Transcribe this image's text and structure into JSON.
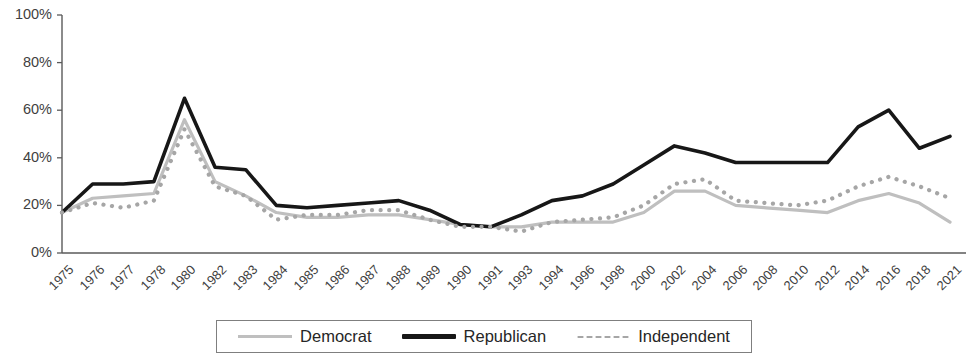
{
  "chart_data": {
    "type": "line",
    "title": "",
    "xlabel": "",
    "ylabel": "",
    "ylim": [
      0,
      100
    ],
    "yticks": [
      0,
      20,
      40,
      60,
      80,
      100
    ],
    "ytick_labels": [
      "0%",
      "20%",
      "40%",
      "60%",
      "80%",
      "100%"
    ],
    "grid": false,
    "legend_position": "bottom",
    "categories": [
      "1975",
      "1976",
      "1977",
      "1978",
      "1980",
      "1982",
      "1983",
      "1984",
      "1985",
      "1986",
      "1987",
      "1988",
      "1989",
      "1990",
      "1991",
      "1993",
      "1994",
      "1996",
      "1998",
      "2000",
      "2002",
      "2004",
      "2006",
      "2008",
      "2010",
      "2012",
      "2014",
      "2016",
      "2018",
      "2021"
    ],
    "series": [
      {
        "name": "Democrat",
        "color": "#bfbfbf",
        "style": "solid",
        "values": [
          17,
          23,
          24,
          25,
          56,
          30,
          24,
          17,
          15,
          15,
          16,
          16,
          14,
          12,
          11,
          11,
          13,
          13,
          13,
          17,
          26,
          26,
          20,
          19,
          18,
          17,
          22,
          25,
          21,
          13
        ]
      },
      {
        "name": "Republican",
        "color": "#171717",
        "style": "solid",
        "values": [
          17,
          29,
          29,
          30,
          65,
          36,
          35,
          20,
          19,
          20,
          21,
          22,
          18,
          12,
          11,
          16,
          22,
          24,
          29,
          37,
          45,
          42,
          38,
          38,
          38,
          38,
          53,
          60,
          44,
          49
        ]
      },
      {
        "name": "Independent",
        "color": "#a6a6a6",
        "style": "dotted",
        "values": [
          17,
          21,
          19,
          22,
          52,
          28,
          24,
          14,
          16,
          16,
          18,
          18,
          14,
          11,
          11,
          9,
          13,
          14,
          15,
          20,
          29,
          31,
          22,
          21,
          20,
          22,
          28,
          32,
          28,
          23
        ]
      }
    ]
  },
  "legend": {
    "items": [
      {
        "label": "Democrat",
        "swatch": "solid-dem"
      },
      {
        "label": "Republican",
        "swatch": "solid-rep"
      },
      {
        "label": "Independent",
        "swatch": "dotted-ind"
      }
    ]
  }
}
